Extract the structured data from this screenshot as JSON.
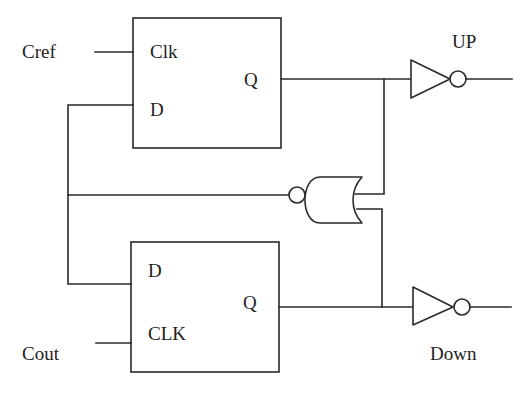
{
  "diagram": {
    "colors": {
      "line": "#2a2a2a",
      "text": "#222222",
      "background": "#ffffff"
    },
    "inputs": {
      "top_clock": "Cref",
      "bottom_clock": "Cout"
    },
    "outputs": {
      "top": "UP",
      "bottom": "Down"
    },
    "flipflops": [
      {
        "id": "ff-top",
        "pins": {
          "clock": "Clk",
          "data": "D",
          "output": "Q"
        }
      },
      {
        "id": "ff-bottom",
        "pins": {
          "data": "D",
          "clock": "CLK",
          "output": "Q"
        }
      }
    ],
    "gates": [
      {
        "id": "nor-reset",
        "type": "NOR",
        "icon": "nor-gate-icon",
        "orientation": "facing-left"
      },
      {
        "id": "inv-up",
        "type": "NOT",
        "icon": "inverter-icon"
      },
      {
        "id": "inv-down",
        "type": "NOT",
        "icon": "inverter-icon"
      }
    ]
  }
}
